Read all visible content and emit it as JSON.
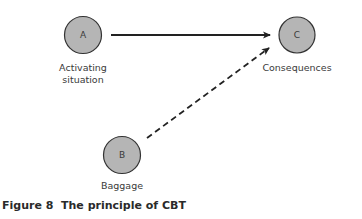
{
  "diagram": {
    "nodes": [
      {
        "id": "A",
        "letter": "A",
        "label_line1": "Activating",
        "label_line2": "situation"
      },
      {
        "id": "B",
        "letter": "B",
        "label": "Baggage"
      },
      {
        "id": "C",
        "letter": "C",
        "label": "Consequences"
      }
    ],
    "edges": [
      {
        "from": "A",
        "to": "C",
        "style": "solid"
      },
      {
        "from": "B",
        "to": "C",
        "style": "dashed"
      }
    ],
    "node_fill": "#b5b5b5",
    "node_stroke": "#333333",
    "caption": "Figure 8  The principle of CBT"
  }
}
